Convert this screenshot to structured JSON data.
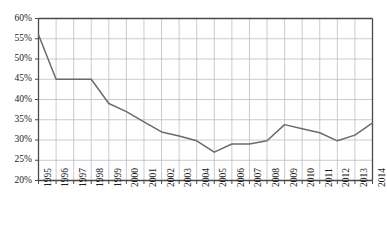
{
  "chart_data": {
    "type": "line",
    "title": "",
    "subtitle": "",
    "xlabel": "",
    "ylabel": "",
    "grid": true,
    "legend": "none",
    "categories": [
      "1995",
      "1996",
      "1997",
      "1998",
      "1999",
      "2000",
      "2001",
      "2002",
      "2003",
      "2004",
      "2005",
      "2006",
      "2007",
      "2008",
      "2009",
      "2010",
      "2011",
      "2012",
      "2013",
      "2014"
    ],
    "values": [
      56.0,
      45.0,
      45.0,
      45.0,
      39.0,
      37.0,
      34.5,
      32.0,
      31.0,
      29.8,
      27.0,
      29.0,
      29.0,
      29.8,
      33.8,
      32.8,
      31.8,
      29.8,
      31.2,
      34.2
    ],
    "series": [
      {
        "name": "series-1",
        "values": [
          56.0,
          45.0,
          45.0,
          45.0,
          39.0,
          37.0,
          34.5,
          32.0,
          31.0,
          29.8,
          27.0,
          29.0,
          29.0,
          29.8,
          33.8,
          32.8,
          31.8,
          29.8,
          31.2,
          34.2
        ],
        "color": "#6b6b6b"
      }
    ],
    "ylim": [
      20,
      60
    ],
    "yticks": [
      20,
      25,
      30,
      35,
      40,
      45,
      50,
      55,
      60
    ],
    "ytick_labels": [
      "20%",
      "25%",
      "30%",
      "35%",
      "40%",
      "45%",
      "50%",
      "55%",
      "60%"
    ],
    "xtick_labels": [
      "1995",
      "1996",
      "1997",
      "1998",
      "1999",
      "2000",
      "2001",
      "2002",
      "2003",
      "2004",
      "2005",
      "2006",
      "2007",
      "2008",
      "2009",
      "2010",
      "2011",
      "2012",
      "2013",
      "2014"
    ],
    "colors": {
      "line": "#6b6b6b",
      "grid": "#b9bfc9",
      "axis": "#4a4a4a",
      "text": "#1b1b1b",
      "background": "#ffffff"
    }
  }
}
